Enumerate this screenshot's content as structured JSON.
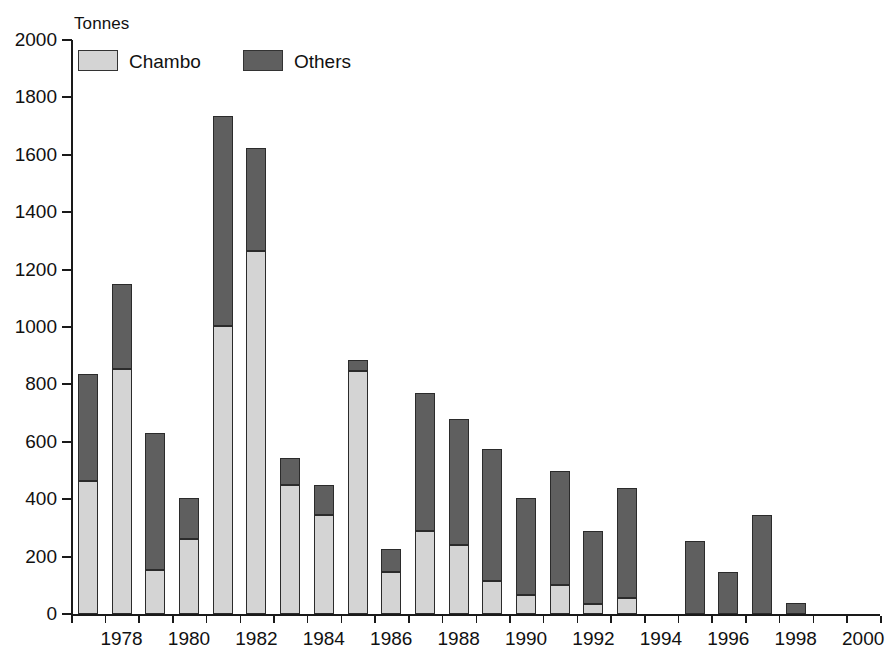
{
  "chart_data": {
    "type": "bar",
    "subtype": "stacked-vertical",
    "title": "",
    "subtitle": "",
    "xlabel": "",
    "ylabel": "Tonnes",
    "ylim": [
      0,
      2000
    ],
    "ytick_step": 200,
    "ytick_labels": [
      "0",
      "200",
      "400",
      "600",
      "800",
      "1000",
      "1200",
      "1400",
      "1600",
      "1800",
      "2000"
    ],
    "ytick_values": [
      0,
      200,
      400,
      600,
      800,
      1000,
      1200,
      1400,
      1600,
      1800,
      2000
    ],
    "xtick_labels": [
      "1978",
      "1980",
      "1982",
      "1984",
      "1986",
      "1988",
      "1990",
      "1992",
      "1994",
      "1996",
      "1998",
      "2000"
    ],
    "xtick_values": [
      1978,
      1980,
      1982,
      1984,
      1986,
      1988,
      1990,
      1992,
      1994,
      1996,
      1998,
      2000
    ],
    "grid": false,
    "legend_position": "top-left",
    "categories": [
      1977,
      1978,
      1979,
      1980,
      1981,
      1982,
      1983,
      1984,
      1985,
      1986,
      1987,
      1988,
      1989,
      1990,
      1991,
      1992,
      1993,
      1994,
      1995,
      1996,
      1997,
      1998,
      1999,
      2000
    ],
    "series": [
      {
        "name": "Chambo",
        "color": "#d4d4d4",
        "values": [
          465,
          855,
          155,
          260,
          1005,
          1265,
          450,
          345,
          845,
          145,
          290,
          240,
          115,
          65,
          100,
          35,
          55,
          0,
          0,
          0,
          0,
          0,
          0,
          0
        ]
      },
      {
        "name": "Others",
        "color": "#5f5f5f",
        "values": [
          370,
          295,
          475,
          145,
          730,
          360,
          95,
          105,
          40,
          80,
          480,
          440,
          460,
          340,
          400,
          255,
          385,
          0,
          255,
          145,
          345,
          40,
          0,
          0
        ]
      }
    ],
    "totals": [
      835,
      1150,
      630,
      405,
      1735,
      1625,
      545,
      450,
      885,
      225,
      770,
      680,
      575,
      405,
      500,
      290,
      440,
      0,
      255,
      145,
      345,
      40,
      0,
      0
    ]
  },
  "legend": {
    "items": [
      {
        "label": "Chambo",
        "color": "#d4d4d4"
      },
      {
        "label": "Others",
        "color": "#5f5f5f"
      }
    ]
  },
  "axis": {
    "unit_label": "Tonnes"
  },
  "colors": {
    "chambo": "#d4d4d4",
    "others": "#5f5f5f",
    "axis": "#1a1a1a",
    "bar_outline": "#2b2b2b",
    "background": "#ffffff"
  }
}
